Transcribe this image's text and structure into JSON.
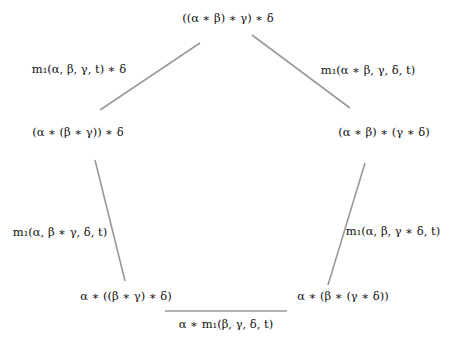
{
  "diagram": {
    "type": "pentagon-coherence-diagram",
    "edge_color": "#999999",
    "text_color": "#111111",
    "nodes": [
      {
        "id": "top",
        "label": "((α ∗ β) ∗ γ) ∗ δ",
        "x": 228,
        "y": 19
      },
      {
        "id": "left",
        "label": "(α ∗ (β ∗ γ)) ∗ δ",
        "x": 78,
        "y": 133
      },
      {
        "id": "right",
        "label": "(α ∗ β) ∗ (γ ∗ δ)",
        "x": 384,
        "y": 133
      },
      {
        "id": "bottom-left",
        "label": "α ∗ ((β ∗ γ) ∗ δ)",
        "x": 126,
        "y": 297
      },
      {
        "id": "bottom-right",
        "label": "α ∗ (β ∗ (γ ∗ δ))",
        "x": 343,
        "y": 297
      }
    ],
    "edges": [
      {
        "id": "top-left",
        "label": "m₁(α, β, γ, t) ∗ δ",
        "x1": 200,
        "y1": 43,
        "x2": 100,
        "y2": 110,
        "lx": 79,
        "ly": 70
      },
      {
        "id": "top-right",
        "label": "m₁(α ∗ β, γ, δ, t)",
        "x1": 252,
        "y1": 35,
        "x2": 350,
        "y2": 108,
        "lx": 368,
        "ly": 71
      },
      {
        "id": "left",
        "label": "m₁(α, β ∗ γ, δ, t)",
        "x1": 95,
        "y1": 160,
        "x2": 125,
        "y2": 281,
        "lx": 60,
        "ly": 233
      },
      {
        "id": "right",
        "label": "m₁(α, β, γ ∗ δ, t)",
        "x1": 365,
        "y1": 163,
        "x2": 328,
        "y2": 285,
        "lx": 393,
        "ly": 232
      },
      {
        "id": "bottom",
        "label": "α ∗ m₁(β, γ, δ, t)",
        "x1": 165,
        "y1": 311,
        "x2": 287,
        "y2": 311,
        "lx": 226,
        "ly": 325
      }
    ]
  }
}
